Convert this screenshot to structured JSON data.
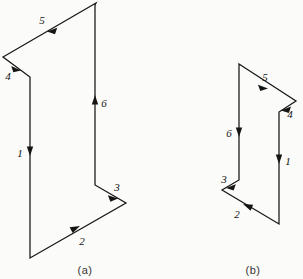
{
  "figure": {
    "background_color": "#fbfbf9",
    "stroke_color": "#151515",
    "panels": [
      {
        "id": "a",
        "caption": "(a)",
        "caption_x": 85,
        "caption_y": 272,
        "outline": "M 96,3 L 3,57 L 30,77 L 30,258 L 126,203 L 95,185 L 95,5 Z",
        "segments": [
          {
            "number": "1",
            "label_x": 22,
            "label_y": 153,
            "arrow_x": 30,
            "arrow_y": 150,
            "direction": "down",
            "description": "left vertical edge downward"
          },
          {
            "number": "2",
            "label_x": 81,
            "label_y": 243,
            "arrow_x": 74,
            "arrow_y": 228,
            "direction": "up-right",
            "description": "bottom diagonal edge toward lower-right notch"
          },
          {
            "number": "3",
            "label_x": 116,
            "label_y": 190,
            "arrow_x": 113,
            "arrow_y": 196,
            "direction": "down-right",
            "description": "notch diagonal to right-most point"
          },
          {
            "number": "4",
            "label_x": 9,
            "label_y": 77,
            "arrow_x": 16,
            "arrow_y": 67,
            "direction": "down-right",
            "description": "upper-left diagonal into the left notch"
          },
          {
            "number": "5",
            "label_x": 43,
            "label_y": 23,
            "arrow_x": 52,
            "arrow_y": 28,
            "direction": "down-left",
            "description": "top diagonal edge from apex toward the left"
          },
          {
            "number": "6",
            "label_x": 102,
            "label_y": 105,
            "arrow_x": 95,
            "arrow_y": 100,
            "direction": "up",
            "description": "right vertical edge upward to apex"
          }
        ]
      },
      {
        "id": "b",
        "caption": "(b)",
        "caption_x": 252,
        "caption_y": 272,
        "outline": "M 239,64 L 296,101 L 279,112 L 279,224 L 222,190 L 239,180 L 239,66 Z",
        "segments": [
          {
            "number": "1",
            "label_x": 285,
            "label_y": 162,
            "arrow_x": 279,
            "arrow_y": 158,
            "direction": "down",
            "description": "right vertical edge downward"
          },
          {
            "number": "2",
            "label_x": 238,
            "label_y": 215,
            "arrow_x": 248,
            "arrow_y": 205,
            "direction": "up-left",
            "description": "bottom diagonal edge toward left notch"
          },
          {
            "number": "3",
            "label_x": 225,
            "label_y": 181,
            "arrow_x": 230,
            "arrow_y": 185,
            "direction": "down-left",
            "description": "notch diagonal to left-most point"
          },
          {
            "number": "4",
            "label_x": 288,
            "label_y": 115,
            "arrow_x": 284,
            "arrow_y": 109,
            "direction": "down-left",
            "description": "upper-right diagonal into the right notch"
          },
          {
            "number": "5",
            "label_x": 266,
            "label_y": 80,
            "arrow_x": 262,
            "arrow_y": 86,
            "direction": "down-right",
            "description": "top diagonal edge from apex toward the right"
          },
          {
            "number": "6",
            "label_x": 228,
            "label_y": 133,
            "arrow_x": 239,
            "arrow_y": 131,
            "direction": "down",
            "description": "left vertical edge downward"
          }
        ]
      }
    ]
  }
}
